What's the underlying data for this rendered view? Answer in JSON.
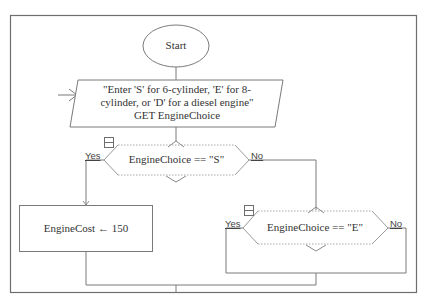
{
  "flowchart": {
    "start": {
      "label": "Start"
    },
    "input": {
      "lines": [
        "\"Enter 'S' for 6-cylinder, 'E' for 8-",
        "cylinder, or 'D' for a diesel engine\"",
        "GET EngineChoice"
      ]
    },
    "decision1": {
      "condition": "EngineChoice == \"S\"",
      "yes_label": "Yes",
      "no_label": "No",
      "collapse_icon": "minus-box-icon"
    },
    "assign1": {
      "text": "EngineCost ← 150"
    },
    "decision2": {
      "condition": "EngineChoice == \"E\"",
      "yes_label": "Yes",
      "no_label": "No",
      "collapse_icon": "minus-box-icon"
    },
    "colors": {
      "line": "#7a7a7a",
      "frame": "#6e6e6e",
      "text": "#333333",
      "dotted": "#9a9a9a"
    }
  }
}
